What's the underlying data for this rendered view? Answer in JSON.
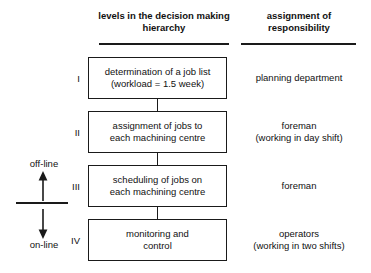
{
  "headers": {
    "levels": "levels in the decision\nmaking hierarchy",
    "responsibility": "assignment of\nresponsibility"
  },
  "mode_axis": {
    "offline_label": "off-line",
    "online_label": "on-line",
    "up_arrow_icon": "arrow-up-icon",
    "down_arrow_icon": "arrow-down-icon"
  },
  "levels": [
    {
      "numeral": "I",
      "box_text": "determination of a job list\n(workload = 1.5 week)",
      "responsibility": "planning department"
    },
    {
      "numeral": "II",
      "box_text": "assignment of jobs to\neach machining centre",
      "responsibility": "foreman\n(working in day shift)"
    },
    {
      "numeral": "III",
      "box_text": "scheduling of jobs on\neach machining centre",
      "responsibility": "foreman"
    },
    {
      "numeral": "IV",
      "box_text": "monitoring and\ncontrol",
      "responsibility": "operators\n(working in two shifts)"
    }
  ],
  "colors": {
    "line": "#1a1a1a",
    "text": "#111111",
    "background": "#ffffff"
  }
}
